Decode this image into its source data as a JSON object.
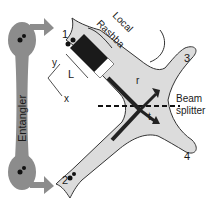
{
  "diagram": {
    "entangler_label": "Entangler",
    "local_rashba_line1": "Local",
    "local_rashba_line2": "Rashba",
    "lead_labels": [
      "1",
      "2",
      "3",
      "4"
    ],
    "beam_splitter_line1": "Beam",
    "beam_splitter_line2": "splitter",
    "axis_labels": {
      "x": "x",
      "y": "y",
      "L": "L"
    },
    "arrow_labels": {
      "r": "r",
      "t": "t"
    },
    "colors": {
      "entangler_fill": "#8c8c8c",
      "channel_fill": "#dcdcdc",
      "rashba_region": "#1a1a1a",
      "outline": "#333333"
    }
  }
}
